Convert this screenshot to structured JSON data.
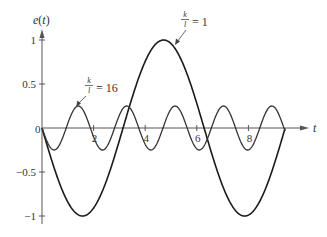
{
  "chart_data": {
    "type": "line",
    "title": "",
    "xlabel": "t",
    "ylabel": "e(t)",
    "xlim": [
      0,
      9.6
    ],
    "ylim": [
      -1.1,
      1.1
    ],
    "x_ticks": [
      2,
      4,
      6,
      8
    ],
    "x_tick_labels": [
      "2",
      "4",
      "6",
      "8"
    ],
    "origin_label": "0",
    "y_ticks": [
      1,
      0.5,
      -0.5,
      -1
    ],
    "y_tick_labels": [
      "1",
      "0.5",
      "-0.5",
      "-1"
    ],
    "grid": false,
    "legend": "none (inline annotations)",
    "series": [
      {
        "name": "k/l = 1",
        "formula": "e(t) = -sin(t)",
        "t_range": [
          0,
          9.42
        ],
        "amplitude": 1,
        "color": "#1a1a1a",
        "x": [
          0,
          1.57,
          3.14,
          4.71,
          6.28,
          7.85,
          9.42
        ],
        "values": [
          0,
          -1,
          0,
          1,
          0,
          -1,
          0
        ]
      },
      {
        "name": "k/l = 16",
        "formula": "e(t) ≈ -0.25·sin(3.35t)",
        "t_range": [
          0,
          9.42
        ],
        "amplitude": 0.25,
        "color": "#1a1a1a",
        "x": [
          0,
          0.47,
          1.41,
          2.34,
          3.28,
          4.22,
          5.16,
          6.1,
          7.03,
          7.97,
          8.91
        ],
        "values": [
          0,
          -0.25,
          0.25,
          -0.25,
          0.25,
          -0.25,
          0.25,
          -0.25,
          0.25,
          -0.25,
          0.25
        ]
      }
    ],
    "annotations": [
      {
        "text": "k/l = 1",
        "points_to": "peak of k/l=1 curve near t≈4.9"
      },
      {
        "text": "k/l = 16",
        "points_to": "first peak of k/l=16 curve near t≈1.3"
      }
    ]
  },
  "labels": {
    "ylabel_e": "e",
    "ylabel_t": "(t)",
    "xlabel": "t",
    "ann1_k": "k",
    "ann1_l": "l",
    "ann1_eq": "= 1",
    "ann2_k": "k",
    "ann2_l": "l",
    "ann2_eq": "= 16"
  }
}
